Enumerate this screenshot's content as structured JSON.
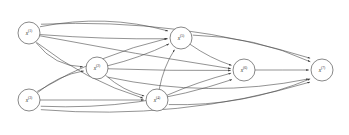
{
  "figure": {
    "name": "directed-acyclic-graph",
    "type": "node-link-diagram",
    "background_color": "#ffffff",
    "edge_color": "#4a4a4a",
    "node_fill_color": "#ffffff",
    "node_stroke_color": "#555555",
    "label_color": "#2b2b2b",
    "width": 349,
    "height": 135
  },
  "nodes": [
    {
      "id": "n1",
      "base": "x",
      "sup": "(1)",
      "label": "x(1)",
      "cx": 29,
      "cy": 33,
      "r": 11
    },
    {
      "id": "n2",
      "base": "x",
      "sup": "(2)",
      "label": "x(2)",
      "cx": 97,
      "cy": 68,
      "r": 11
    },
    {
      "id": "n3",
      "base": "x",
      "sup": "(3)",
      "label": "x(3)",
      "cx": 29,
      "cy": 100,
      "r": 11
    },
    {
      "id": "n4",
      "base": "x",
      "sup": "(4)",
      "label": "x(4)",
      "cx": 157,
      "cy": 100,
      "r": 11
    },
    {
      "id": "n5",
      "base": "x",
      "sup": "(5)",
      "label": "x(5)",
      "cx": 181,
      "cy": 38,
      "r": 11
    },
    {
      "id": "n6",
      "base": "x",
      "sup": "(6)",
      "label": "x(6)",
      "cx": 244,
      "cy": 70,
      "r": 11
    },
    {
      "id": "n7",
      "base": "x",
      "sup": "(7)",
      "label": "x(7)",
      "cx": 322,
      "cy": 70,
      "r": 11
    }
  ],
  "edges": [
    {
      "id": "e1",
      "from": "n1",
      "to": "n2",
      "curve": 18
    },
    {
      "id": "e2",
      "from": "n1",
      "to": "n4",
      "curve": 16
    },
    {
      "id": "e3",
      "from": "n1",
      "to": "n5",
      "curve": -22
    },
    {
      "id": "e4",
      "from": "n1",
      "to": "n5",
      "curve": 4
    },
    {
      "id": "e5",
      "from": "n1",
      "to": "n6",
      "curve": 3
    },
    {
      "id": "e6",
      "from": "n1",
      "to": "n7",
      "curve": -34
    },
    {
      "id": "e7",
      "from": "n2",
      "to": "n4",
      "curve": 8
    },
    {
      "id": "e8",
      "from": "n2",
      "to": "n5",
      "curve": 5
    },
    {
      "id": "e9",
      "from": "n2",
      "to": "n6",
      "curve": 2
    },
    {
      "id": "e10",
      "from": "n2",
      "to": "n7",
      "curve": 30
    },
    {
      "id": "e11",
      "from": "n3",
      "to": "n2",
      "curve": -10
    },
    {
      "id": "e12",
      "from": "n3",
      "to": "n4",
      "curve": 0
    },
    {
      "id": "e13",
      "from": "n3",
      "to": "n5",
      "curve": -16
    },
    {
      "id": "e14",
      "from": "n3",
      "to": "n6",
      "curve": 26
    },
    {
      "id": "e15",
      "from": "n3",
      "to": "n7",
      "curve": 36
    },
    {
      "id": "e16",
      "from": "n4",
      "to": "n5",
      "curve": -6
    },
    {
      "id": "e17",
      "from": "n4",
      "to": "n6",
      "curve": -4
    },
    {
      "id": "e18",
      "from": "n4",
      "to": "n7",
      "curve": 22
    },
    {
      "id": "e19",
      "from": "n5",
      "to": "n6",
      "curve": 5
    },
    {
      "id": "e20",
      "from": "n5",
      "to": "n7",
      "curve": -18
    },
    {
      "id": "e21",
      "from": "n6",
      "to": "n7",
      "curve": 0
    }
  ]
}
